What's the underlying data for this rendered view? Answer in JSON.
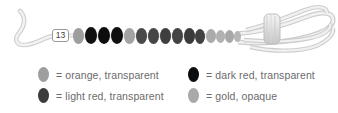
{
  "figure": {
    "caption_number": "13",
    "photo_alt": "strand of oval beads on a cord with coiled cord bundle",
    "bead_strand": {
      "count": 15,
      "beads": [
        {
          "index": 1,
          "color_name": "orange, transparent",
          "hex": "#9e9e9e"
        },
        {
          "index": 2,
          "color_name": "dark red, transparent",
          "hex": "#101010"
        },
        {
          "index": 3,
          "color_name": "dark red, transparent",
          "hex": "#0d0d0d"
        },
        {
          "index": 4,
          "color_name": "dark red, transparent",
          "hex": "#0f0f0f"
        },
        {
          "index": 5,
          "color_name": "orange, transparent",
          "hex": "#a3a3a3"
        },
        {
          "index": 6,
          "color_name": "light red, transparent",
          "hex": "#4a4a4a"
        },
        {
          "index": 7,
          "color_name": "light red, transparent",
          "hex": "#464646"
        },
        {
          "index": 8,
          "color_name": "light red, transparent",
          "hex": "#3f3f3f"
        },
        {
          "index": 9,
          "color_name": "light red, transparent",
          "hex": "#444444"
        },
        {
          "index": 10,
          "color_name": "light red, transparent",
          "hex": "#3b3b3b"
        },
        {
          "index": 11,
          "color_name": "light red, transparent",
          "hex": "#414141"
        },
        {
          "index": 12,
          "color_name": "gold, opaque",
          "hex": "#ababab"
        },
        {
          "index": 13,
          "color_name": "gold, opaque",
          "hex": "#b2b2b2"
        },
        {
          "index": 14,
          "color_name": "gold, opaque",
          "hex": "#a8a8a8"
        },
        {
          "index": 15,
          "color_name": "gold, opaque",
          "hex": "#b6b6b6"
        }
      ]
    },
    "cord": {
      "color_hex": "#e2e2e2",
      "outline_hex": "#bdbdbd",
      "background_hex": "#ffffff"
    }
  },
  "legend": {
    "equals": "=",
    "entries": [
      {
        "id": "orange-transparent",
        "label": "orange, transparent",
        "swatch_hex": "#9e9e9e",
        "row": 0,
        "col": 0
      },
      {
        "id": "dark-red-transparent",
        "label": "dark red, transparent",
        "swatch_hex": "#0d0d0d",
        "row": 0,
        "col": 1
      },
      {
        "id": "light-red-transparent",
        "label": "light red, transparent",
        "swatch_hex": "#3c3c3c",
        "row": 1,
        "col": 0
      },
      {
        "id": "gold-opaque",
        "label": "gold, opaque",
        "swatch_hex": "#a9a9a9",
        "row": 1,
        "col": 1
      }
    ]
  }
}
